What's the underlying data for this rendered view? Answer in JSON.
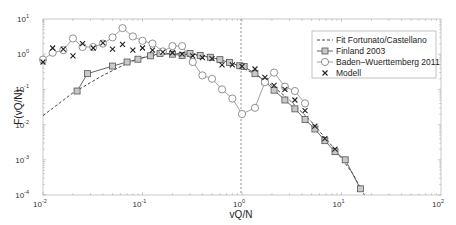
{
  "chart_data": {
    "type": "line",
    "title": "",
    "xlabel": "vQ/N",
    "ylabel": "F(vQ/N)",
    "xscale": "log",
    "yscale": "log",
    "xlim": [
      0.01,
      100
    ],
    "ylim": [
      0.0001,
      10
    ],
    "x_ticks": [
      "10^-2",
      "10^-1",
      "10^0",
      "10^1",
      "10^2"
    ],
    "y_ticks": [
      "10^-4",
      "10^-3",
      "10^-2",
      "10^-1",
      "10^0",
      "10^1"
    ],
    "grid": false,
    "legend_position": "upper right",
    "annotations": [
      {
        "type": "vertical-dashed-line",
        "x": 1
      }
    ],
    "series": [
      {
        "name": "Fit Fortunato/Castellano",
        "style": "dashed",
        "marker": "none",
        "x": [
          0.01,
          0.02,
          0.04,
          0.07,
          0.1,
          0.15,
          0.2,
          0.3,
          0.5,
          0.8,
          1,
          1.5,
          2,
          3,
          5,
          8,
          10,
          13,
          17
        ],
        "y": [
          0.018,
          0.08,
          0.25,
          0.55,
          0.8,
          1.0,
          1.05,
          1.0,
          0.8,
          0.55,
          0.42,
          0.23,
          0.13,
          0.05,
          0.012,
          0.0025,
          0.0011,
          0.0004,
          0.0001
        ]
      },
      {
        "name": "Finland 2003",
        "marker": "square",
        "x": [
          0.022,
          0.028,
          0.05,
          0.07,
          0.09,
          0.12,
          0.15,
          0.2,
          0.25,
          0.3,
          0.38,
          0.48,
          0.6,
          0.75,
          0.95,
          1.05,
          1.35,
          1.7,
          2.1,
          2.7,
          3.4,
          4.3,
          5.4,
          6.8,
          8.6,
          10.9,
          15.5
        ],
        "y": [
          0.09,
          0.28,
          0.46,
          0.6,
          0.72,
          0.9,
          1.05,
          1.0,
          0.92,
          1.05,
          0.92,
          0.82,
          0.7,
          0.58,
          0.47,
          0.45,
          0.28,
          0.17,
          0.095,
          0.05,
          0.028,
          0.014,
          0.0075,
          0.0035,
          0.0017,
          0.001,
          0.00015
        ]
      },
      {
        "name": "Baden-Wuerttemberg 2011",
        "marker": "circle",
        "x": [
          0.01,
          0.0125,
          0.016,
          0.02,
          0.025,
          0.032,
          0.04,
          0.05,
          0.063,
          0.08,
          0.1,
          0.126,
          0.16,
          0.2,
          0.25,
          0.32,
          0.4,
          0.5,
          0.63,
          0.8,
          1.0,
          1.35,
          1.7,
          2.1,
          2.7,
          3.4,
          4.3
        ],
        "y": [
          0.7,
          1.1,
          1.3,
          2.8,
          1.6,
          1.6,
          2.0,
          3.0,
          5.5,
          3.2,
          2.4,
          2.0,
          1.2,
          1.7,
          1.7,
          0.6,
          0.25,
          0.2,
          0.1,
          0.055,
          0.02,
          0.03,
          0.16,
          0.3,
          0.12,
          0.09,
          0.04
        ]
      },
      {
        "name": "Modell",
        "marker": "x",
        "x": [
          0.01,
          0.0125,
          0.016,
          0.02,
          0.025,
          0.032,
          0.04,
          0.05,
          0.063,
          0.08,
          0.1,
          0.126,
          0.16,
          0.2,
          0.25,
          0.32,
          0.4,
          0.5,
          0.63,
          0.8,
          1.0,
          1.35,
          1.7,
          2.1,
          2.7,
          3.4,
          4.3,
          5.4,
          6.8,
          8.6
        ],
        "y": [
          0.6,
          1.5,
          1.4,
          0.9,
          2.0,
          1.5,
          2.1,
          1.4,
          1.9,
          1.3,
          1.5,
          1.3,
          1.15,
          1.1,
          1.0,
          0.9,
          0.8,
          0.75,
          0.5,
          0.5,
          0.45,
          0.38,
          0.22,
          0.13,
          0.1,
          0.05,
          0.025,
          0.009,
          0.004,
          0.002
        ]
      }
    ]
  }
}
